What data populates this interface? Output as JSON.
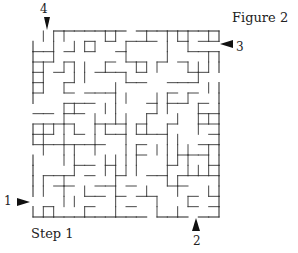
{
  "figure": {
    "title": "Figure 2",
    "step": "Step 1"
  },
  "markers": [
    {
      "label": "4",
      "direction": "down"
    },
    {
      "label": "3",
      "direction": "left"
    },
    {
      "label": "1",
      "direction": "right"
    },
    {
      "label": "2",
      "direction": "up"
    }
  ],
  "maze": {
    "cols": 18,
    "rows": 18,
    "left": 33,
    "top": 31,
    "size": 186,
    "line_color": "#333333"
  }
}
